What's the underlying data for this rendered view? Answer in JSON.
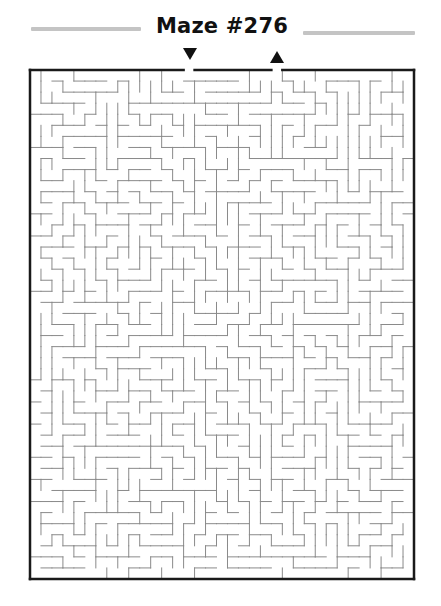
{
  "header": {
    "title": "Maze #276",
    "rule_color": "#c4c4c4"
  },
  "maze": {
    "cols": 35,
    "rows": 46,
    "left": 30,
    "top": 70,
    "right": 414,
    "bottom": 579,
    "entrance_col": 14,
    "exit_col": 22,
    "entrance_marker": "down-arrow",
    "exit_marker": "up-arrow",
    "wall_color": "#8a8a8a",
    "border_color": "#1a1a1a",
    "seed": 276
  }
}
